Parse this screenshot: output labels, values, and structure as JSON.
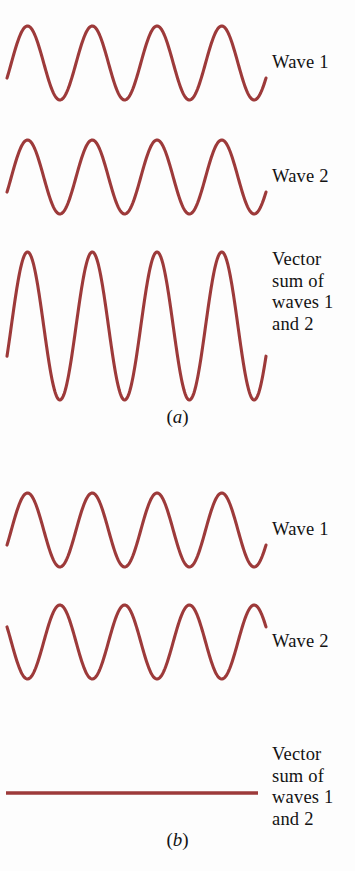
{
  "figure": {
    "background_color": "#fdfdfd",
    "wave_color": "#9d3a3a",
    "text_color": "#131313"
  },
  "panels": [
    {
      "id": "a",
      "caption_open": "(",
      "caption_letter": "a",
      "caption_close": ")",
      "caption": "(a)",
      "traces": [
        {
          "name": "wave-1",
          "label": "Wave 1",
          "kind": "sine",
          "amplitude": 37,
          "cycles": 4,
          "phase_deg": 0,
          "inverted": false
        },
        {
          "name": "wave-2",
          "label": "Wave 2",
          "kind": "sine",
          "amplitude": 37,
          "cycles": 4,
          "phase_deg": 0,
          "inverted": false
        },
        {
          "name": "vector-sum",
          "label": "Vector\nsum of\nwaves 1\nand 2",
          "kind": "sine",
          "amplitude": 74,
          "cycles": 4,
          "phase_deg": 0,
          "inverted": false
        }
      ]
    },
    {
      "id": "b",
      "caption_open": "(",
      "caption_letter": "b",
      "caption_close": ")",
      "caption": "(b)",
      "traces": [
        {
          "name": "wave-1",
          "label": "Wave 1",
          "kind": "sine",
          "amplitude": 37,
          "cycles": 4,
          "phase_deg": 0,
          "inverted": false
        },
        {
          "name": "wave-2",
          "label": "Wave 2",
          "kind": "sine",
          "amplitude": 37,
          "cycles": 4,
          "phase_deg": 180,
          "inverted": true
        },
        {
          "name": "vector-sum",
          "label": "Vector\nsum of\nwaves 1\nand 2",
          "kind": "flat",
          "amplitude": 0,
          "cycles": 0,
          "phase_deg": 0,
          "inverted": false
        }
      ]
    }
  ],
  "chart_data": {
    "type": "line",
    "title": "",
    "xlabel": "",
    "ylabel": "",
    "grid": false,
    "legend": "right",
    "series": [
      {
        "name": "a-wave-1",
        "panel": "a",
        "label": "Wave 1",
        "amplitude": 1.0,
        "cycles": 4,
        "phase_deg": 0,
        "baseline_y": 63
      },
      {
        "name": "a-wave-2",
        "panel": "a",
        "label": "Wave 2",
        "amplitude": 1.0,
        "cycles": 4,
        "phase_deg": 0,
        "baseline_y": 177
      },
      {
        "name": "a-vector-sum",
        "panel": "a",
        "label": "Vector sum of waves 1 and 2",
        "amplitude": 2.0,
        "cycles": 4,
        "phase_deg": 0,
        "baseline_y": 326
      },
      {
        "name": "b-wave-1",
        "panel": "b",
        "label": "Wave 1",
        "amplitude": 1.0,
        "cycles": 4,
        "phase_deg": 0,
        "baseline_y": 530
      },
      {
        "name": "b-wave-2",
        "panel": "b",
        "label": "Wave 2",
        "amplitude": 1.0,
        "cycles": 4,
        "phase_deg": 180,
        "baseline_y": 642
      },
      {
        "name": "b-vector-sum",
        "panel": "b",
        "label": "Vector sum of waves 1 and 2",
        "amplitude": 0.0,
        "cycles": 0,
        "phase_deg": 0,
        "baseline_y": 793
      }
    ]
  }
}
